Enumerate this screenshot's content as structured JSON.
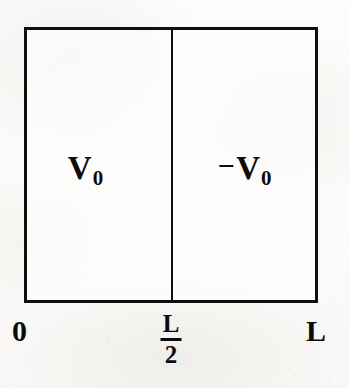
{
  "figure": {
    "type": "potential-well-diagram",
    "ink_color": "#100f0d",
    "paper_color": "#fdfdfc"
  },
  "regions": [
    {
      "name": "left-region",
      "label": "V",
      "subscript": "0",
      "sign": "",
      "value_text": "V0",
      "domain": "0 to L/2"
    },
    {
      "name": "right-region",
      "label": "V",
      "subscript": "0",
      "sign": "−",
      "value_text": "-V0",
      "domain": "L/2 to L"
    }
  ],
  "axis": {
    "origin_label": "0",
    "midpoint": {
      "numerator": "L",
      "denominator": "2",
      "text": "L/2"
    },
    "end_label": "L"
  }
}
